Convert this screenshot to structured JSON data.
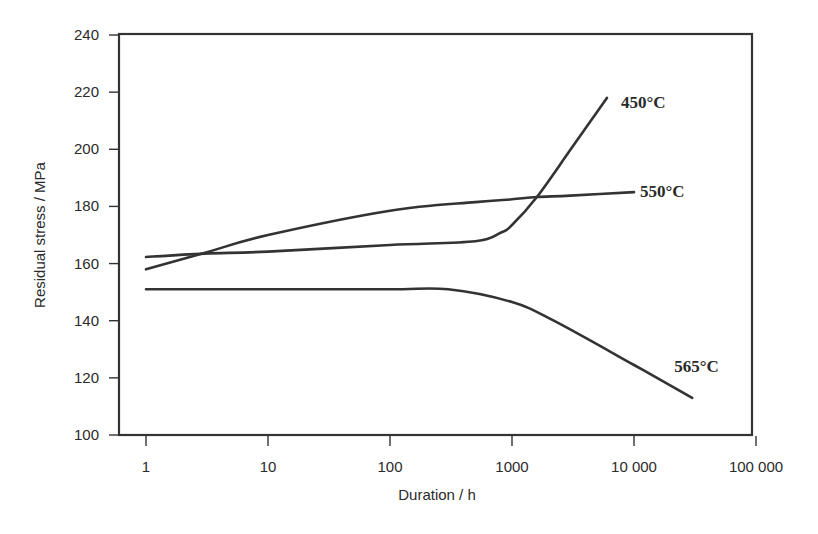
{
  "chart_data": {
    "type": "line",
    "title": "",
    "xlabel": "Duration / h",
    "ylabel": "Residual stress / MPa",
    "xscale": "log",
    "xlim": [
      1,
      100000
    ],
    "ylim": [
      100,
      240
    ],
    "grid": false,
    "legend": "inline labels at curve ends",
    "x_ticks": [
      1,
      10,
      100,
      1000,
      10000,
      100000
    ],
    "x_tick_labels": [
      "1",
      "10",
      "100",
      "1000",
      "10 000",
      "100 000"
    ],
    "y_ticks": [
      100,
      120,
      140,
      160,
      180,
      200,
      220,
      240
    ],
    "y_tick_labels": [
      "100",
      "120",
      "140",
      "160",
      "180",
      "200",
      "220",
      "240"
    ],
    "series": [
      {
        "name": "450°C",
        "label": "450°C",
        "x": [
          1,
          3,
          10,
          100,
          500,
          800,
          1000,
          1600,
          3000,
          6000
        ],
        "y": [
          162.3,
          163.5,
          164.2,
          166.5,
          167.8,
          170.7,
          173.5,
          183.3,
          199.7,
          218
        ]
      },
      {
        "name": "550°C",
        "label": "550°C",
        "x": [
          1,
          3,
          10,
          100,
          500,
          1000,
          1600,
          3000,
          10000
        ],
        "y": [
          158,
          163.7,
          170,
          178.5,
          181.5,
          182.5,
          183.3,
          183.8,
          185
        ]
      },
      {
        "name": "565°C",
        "label": "565°C",
        "x": [
          1,
          10,
          100,
          300,
          1000,
          2200,
          10000,
          30000
        ],
        "y": [
          151,
          151,
          151,
          151,
          146.5,
          140,
          124.5,
          113
        ]
      }
    ]
  }
}
